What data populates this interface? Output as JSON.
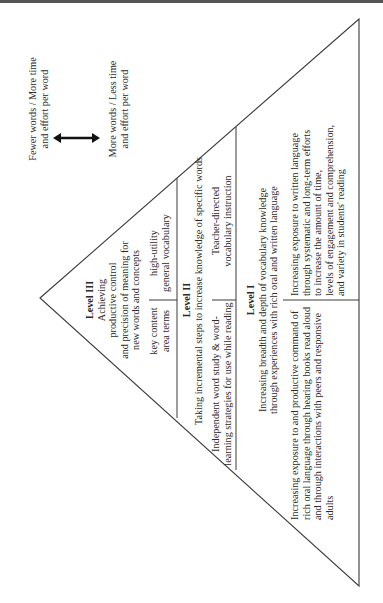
{
  "figure": {
    "scale": {
      "top_label": [
        "Fewer words / More time",
        "and effort per word"
      ],
      "bottom_label": [
        "More words / Less time",
        "and effort per word"
      ],
      "arrow_icon": "double-headed-arrow"
    },
    "levels": [
      {
        "id": "level-3",
        "title": "Level III",
        "description": [
          "Achieving",
          "productive control",
          "and precision of meaning for",
          "new words and concepts"
        ],
        "left_cell": [
          "key content",
          "area terms"
        ],
        "right_cell": [
          "high-utility",
          "general vocabulary"
        ]
      },
      {
        "id": "level-2",
        "title": "Level II",
        "description": [
          "Taking incremental steps to increase knowledge of specific words"
        ],
        "left_cell": [
          "Independent word study & word-",
          "learning strategies for use while reading"
        ],
        "right_cell": [
          "Teacher-directed",
          "vocabulary instruction"
        ]
      },
      {
        "id": "level-1",
        "title": "Level I",
        "description": [
          "Increasing breadth and depth of vocabulary knowledge",
          "through experiences with rich oral and written language"
        ],
        "left_cell": [
          "Increasing exposure to and productive command of",
          "rich oral language through hearing books read aloud",
          "and through interactions with peers and responsive",
          "adults"
        ],
        "right_cell": [
          "Increasing exposure to written language",
          "through systematic and long-term efforts",
          "to increase the amount of time,",
          "levels of engagement and comprehension,",
          "and variety in students' reading"
        ]
      }
    ],
    "colors": {
      "line": "#3a3a3a",
      "text": "#2a2a2a",
      "background": "#ffffff"
    }
  }
}
